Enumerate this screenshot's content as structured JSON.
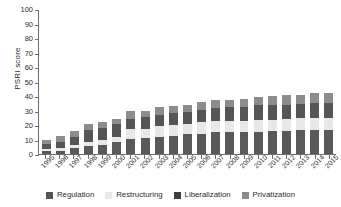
{
  "chart_data": {
    "type": "bar",
    "stacked": true,
    "title": "",
    "xlabel": "",
    "ylabel": "PSRI score",
    "ylim": [
      0,
      100
    ],
    "ytick_step": 10,
    "yticks": [
      0,
      10,
      20,
      30,
      40,
      50,
      60,
      70,
      80,
      90,
      100
    ],
    "grid": false,
    "legend_position": "bottom",
    "categories": [
      "1995",
      "1996",
      "1997",
      "1998",
      "1999",
      "2000",
      "2001",
      "2002",
      "2003",
      "2004",
      "2005",
      "2006",
      "2007",
      "2008",
      "2009",
      "2010",
      "2011",
      "2012",
      "2013",
      "2014",
      "2015"
    ],
    "series": [
      {
        "name": "Liberalization",
        "color": "#595959",
        "values": [
          2,
          2,
          4,
          5.5,
          6.5,
          8,
          10.5,
          11,
          12,
          12.5,
          13.5,
          14,
          15,
          15,
          15.5,
          15.5,
          16,
          16,
          16.5,
          16.5,
          16.5
        ]
      },
      {
        "name": "Restructuring",
        "color": "#e8e8e8",
        "values": [
          1.5,
          2,
          2.5,
          3,
          3.5,
          4,
          7,
          6.5,
          7,
          7.5,
          7.5,
          8,
          7.5,
          8,
          7.5,
          8,
          7.5,
          8,
          8,
          8.5,
          8.5
        ]
      },
      {
        "name": "Regulation",
        "color": "#555555",
        "values": [
          3.5,
          4.5,
          5.5,
          8,
          8,
          8.5,
          6.5,
          8,
          8,
          8,
          8,
          8.5,
          9.5,
          9.5,
          9.5,
          10,
          10,
          10,
          10,
          10,
          10.5
        ]
      },
      {
        "name": "Privatization",
        "color": "#8c8c8c",
        "values": [
          3,
          4,
          4,
          4,
          4,
          4,
          5.5,
          4.5,
          5.5,
          5,
          5,
          5.5,
          5,
          5,
          5.5,
          5.5,
          6.5,
          6.5,
          6.5,
          7,
          6.5
        ]
      }
    ],
    "totals": [
      10,
      12.5,
      16,
      20.5,
      22,
      24.5,
      29.5,
      30,
      32.5,
      33,
      34,
      36,
      37,
      37.5,
      38,
      39,
      40,
      40.5,
      41,
      42,
      42
    ]
  },
  "legend": {
    "items": [
      {
        "label": "Regulation",
        "color": "#555555"
      },
      {
        "label": "Restructuring",
        "color": "#e8e8e8"
      },
      {
        "label": "Liberalization",
        "color": "#3f3f3f"
      },
      {
        "label": "Privatization",
        "color": "#8c8c8c"
      }
    ]
  },
  "axis": {
    "y_title": "PSRI score"
  }
}
